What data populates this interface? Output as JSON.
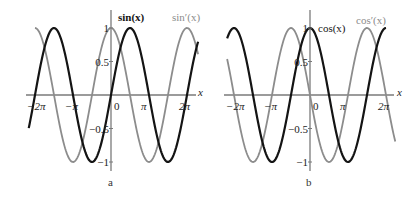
{
  "chart_data": [
    {
      "type": "line",
      "panel_label": "a",
      "xlabel": "x",
      "ylabel": "",
      "xlim": [
        -6.8,
        7.2
      ],
      "ylim": [
        -1.15,
        1.2
      ],
      "grid": false,
      "x_ticks": [
        "−2π",
        "−π",
        "0",
        "π",
        "2π"
      ],
      "x_tick_values": [
        -6.2832,
        -3.1416,
        0,
        3.1416,
        6.2832
      ],
      "y_ticks": [
        "1",
        "0.5",
        "−0.5",
        "−1"
      ],
      "y_tick_values": [
        1,
        0.5,
        -0.5,
        -1
      ],
      "series": [
        {
          "name": "sin(x)",
          "func": "sin",
          "x_range": [
            -6.8,
            7.2
          ],
          "color": "#141414",
          "width": 2.2,
          "label_style": "bold"
        },
        {
          "name": "sin′(x)",
          "func": "cos",
          "x_range": [
            -6.2832,
            7.2
          ],
          "color": "#8c8c8c",
          "width": 1.8,
          "label_style": "normal"
        }
      ],
      "legend": [
        {
          "text": "sin(x)",
          "x": 118,
          "y": 21,
          "color": "#141414"
        },
        {
          "text": "sin′(x)",
          "x": 170,
          "y": 21,
          "color": "#8c8c8c"
        }
      ]
    },
    {
      "type": "line",
      "panel_label": "b",
      "xlabel": "x",
      "ylabel": "",
      "xlim": [
        -6.85,
        7.05
      ],
      "ylim": [
        -1.15,
        1.2
      ],
      "grid": false,
      "x_ticks": [
        "−2π",
        "−π",
        "0",
        "π",
        "2π"
      ],
      "x_tick_values": [
        -6.2832,
        -3.1416,
        0,
        3.1416,
        6.2832
      ],
      "y_ticks": [
        "1",
        "0.5",
        "−0.5",
        "−1"
      ],
      "y_tick_values": [
        1,
        0.5,
        -0.5,
        -1
      ],
      "series": [
        {
          "name": "cos(x)",
          "func": "cos",
          "x_range": [
            -6.85,
            6.2832
          ],
          "color": "#141414",
          "width": 2.2,
          "label_style": "normal"
        },
        {
          "name": "cos′(x)",
          "func": "-sin",
          "x_range": [
            -6.85,
            7.05
          ],
          "color": "#8c8c8c",
          "width": 1.8,
          "label_style": "normal"
        }
      ],
      "legend": [
        {
          "text": "cos(x)",
          "x": 318,
          "y": 32,
          "color": "#141414"
        },
        {
          "text": "cos′(x)",
          "x": 356,
          "y": 24,
          "color": "#8c8c8c"
        }
      ]
    }
  ],
  "panels": [
    {
      "caption": "a"
    },
    {
      "caption": "b"
    }
  ],
  "colors": {
    "axis": "#7a7a7a",
    "primary_curve": "#141414",
    "derivative_curve": "#8c8c8c"
  }
}
